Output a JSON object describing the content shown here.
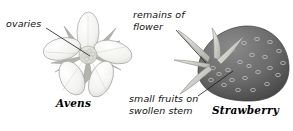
{
  "figure": {
    "background_color": "#ffffff",
    "width": 293,
    "height": 131
  },
  "labels": [
    {
      "id": "ovaries",
      "text": "ovaries",
      "style": "italic",
      "color": "#111111",
      "points_to": "flower-centre-ovaries"
    },
    {
      "id": "remains-of-flower",
      "line1": "remains of",
      "line2": "flower",
      "style": "italic",
      "color": "#111111",
      "points_to": "strawberry-calyx"
    },
    {
      "id": "small-fruits-on-swollen-stem",
      "line1": "small fruits on",
      "line2": "swollen stem",
      "style": "italic",
      "color": "#111111",
      "points_to": "strawberry-achenes"
    }
  ],
  "captions": [
    {
      "id": "avens",
      "text": "Avens",
      "style": "bold-italic-serif",
      "color": "#000000"
    },
    {
      "id": "strawberry",
      "text": "Strawberry",
      "style": "bold-italic-serif",
      "color": "#000000"
    }
  ],
  "illustrations": {
    "avens_flower": {
      "name": "avens-flower",
      "petal_count": 5,
      "sepal_count": 5,
      "petal_color": "#f4f4f2",
      "petal_outline": "#8d8d8d",
      "sepal_color": "#b9b9b5",
      "centre_color": "#e0e0dc",
      "centre_detail": "cluster of small ovaries"
    },
    "strawberry_fruit": {
      "name": "strawberry-fruit",
      "body_color": "#6b6b6b",
      "body_shadow": "#4a4a4a",
      "seed_color": "#c9c9c4",
      "calyx_color": "#d8d8d2",
      "calyx_outline": "#8a8a84"
    }
  },
  "leader_lines": [
    {
      "id": "line-ovaries",
      "from": [
        46,
        28
      ],
      "to": [
        90,
        56
      ],
      "color": "#1a1a1a"
    },
    {
      "id": "line-remains",
      "from": [
        176,
        30
      ],
      "to": [
        206,
        63
      ],
      "color": "#1a1a1a"
    },
    {
      "id": "line-small",
      "from": [
        198,
        96
      ],
      "to": [
        233,
        71
      ],
      "color": "#1a1a1a"
    }
  ]
}
